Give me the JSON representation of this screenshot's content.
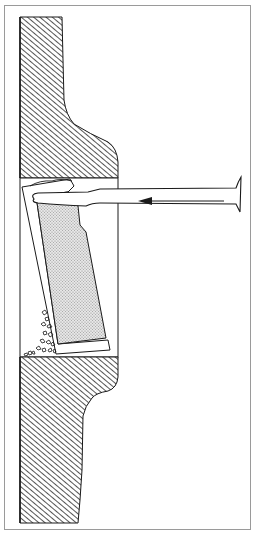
{
  "diagram": {
    "type": "technical cross-section illustration",
    "labels": [],
    "arrow_direction": "left",
    "colors": {
      "line": "#1a1a1a",
      "hatch": "#2a2a2a",
      "panel_fill": "#d8d8d8",
      "frame": "#9a9a9a",
      "background": "#ffffff"
    },
    "elements": [
      {
        "name": "upper-wall-section",
        "fill": "diagonal hatching"
      },
      {
        "name": "lower-wall-section",
        "fill": "diagonal hatching"
      },
      {
        "name": "opening-cavity",
        "fill": "none"
      },
      {
        "name": "tilted-panel",
        "fill": "stippled gray"
      },
      {
        "name": "pry-tool",
        "fill": "none"
      },
      {
        "name": "direction-arrow",
        "points": "left"
      },
      {
        "name": "debris-rubble",
        "fill": "irregular fragments"
      }
    ]
  }
}
